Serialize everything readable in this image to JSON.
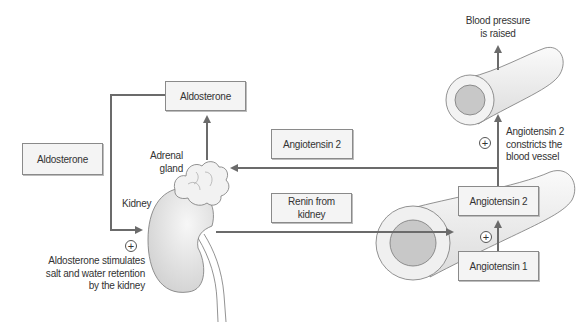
{
  "diagram": {
    "colors": {
      "arrow": "#6b6b6b",
      "box_fill": "#f4f4f4",
      "box_border": "#8a8a8a",
      "organ_fill": "#e6e6e6",
      "vessel_lumen": "#c8c8c8"
    },
    "boxes": {
      "aldosterone_top": "Aldosterone",
      "aldosterone_left": "Aldosterone",
      "angiotensin2_middle": "Angiotensin 2",
      "renin": "Renin from kidney",
      "angiotensin2_right": "Angiotensin 2",
      "angiotensin1": "Angiotensin 1"
    },
    "labels": {
      "adrenal_gland_line1": "Adrenal",
      "adrenal_gland_line2": "gland",
      "kidney": "Kidney",
      "aldosterone_effect_line1": "Aldosterone stimulates",
      "aldosterone_effect_line2": "salt and water retention",
      "aldosterone_effect_line3": "by the kidney",
      "bp_line1": "Blood pressure",
      "bp_line2": "is raised",
      "ang2_effect_line1": "Angiotensin 2",
      "ang2_effect_line2": "constricts the",
      "ang2_effect_line3": "blood vessel"
    },
    "stimulation_symbol": "+",
    "icons": [
      "kidney-illustration",
      "adrenal-gland-illustration",
      "blood-vessel-upper",
      "blood-vessel-lower",
      "plus-circle-icon"
    ]
  }
}
